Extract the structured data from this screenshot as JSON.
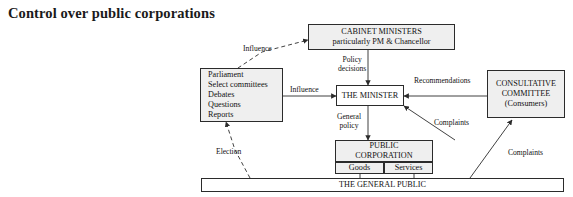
{
  "title": "Control over public corporations",
  "nodes": {
    "cabinet": {
      "lines": [
        "CABINET MINISTERS",
        "particularly PM & Chancellor"
      ]
    },
    "parliament": {
      "lines": [
        "Parliament",
        "Select committees",
        "Debates",
        "Questions",
        "Reports"
      ]
    },
    "minister": {
      "lines": [
        "THE MINISTER"
      ]
    },
    "consultative": {
      "lines": [
        "CONSULTATIVE",
        "COMMITTEE",
        "(Consumers)"
      ]
    },
    "public_corporation": {
      "lines": [
        "PUBLIC",
        "CORPORATION"
      ]
    },
    "goods": {
      "lines": [
        "Goods"
      ]
    },
    "services": {
      "lines": [
        "Services"
      ]
    },
    "general_public": {
      "lines": [
        "THE GENERAL PUBLIC"
      ]
    }
  },
  "edge_labels": {
    "influence_cabinet": "Influence",
    "policy_decisions": "Policy\ndecisions",
    "influence_minister": "Influence",
    "recommendations": "Recommendations",
    "general_policy": "General\npolicy",
    "complaints_to_minister": "Complaints",
    "election": "Election",
    "complaints_from_public": "Complaints"
  },
  "colors": {
    "node_fill": "#efefef",
    "node_stroke": "#2b2b2b",
    "text": "#111111",
    "page_background": "#ffffff"
  }
}
